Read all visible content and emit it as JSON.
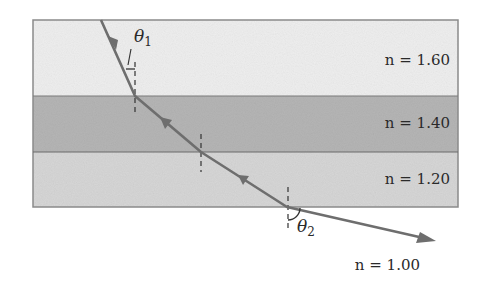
{
  "figure": {
    "layers": [
      {
        "name": "layer-1",
        "index_label": "n = 1.60",
        "n": 1.6,
        "color": "#eeeeee"
      },
      {
        "name": "layer-2",
        "index_label": "n = 1.40",
        "n": 1.4,
        "color": "#b5b5b5"
      },
      {
        "name": "layer-3",
        "index_label": "n = 1.20",
        "n": 1.2,
        "color": "#d6d6d6"
      }
    ],
    "outside_medium": {
      "index_label": "n = 1.00",
      "n": 1.0
    },
    "angles": {
      "incident": {
        "symbol": "θ",
        "subscript": "1"
      },
      "exit": {
        "symbol": "θ",
        "subscript": "2"
      }
    },
    "colors": {
      "ray": "#6e6e6e",
      "border": "#8a8a8a",
      "text": "#2a2a2a"
    }
  }
}
